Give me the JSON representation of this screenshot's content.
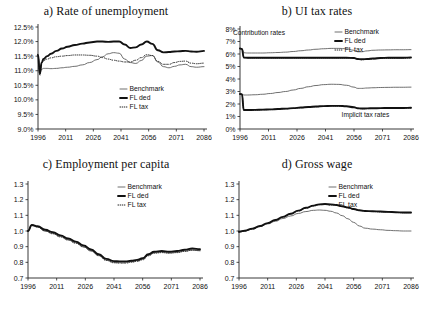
{
  "figure": {
    "background": "#ffffff",
    "series_colors": {
      "benchmark": "#555555",
      "fl_ded": "#111111",
      "fl_tax": "#222222"
    },
    "legend_labels": {
      "benchmark": "Benchmark",
      "fl_ded": "FL ded",
      "fl_tax": "FL tax"
    }
  },
  "panels": {
    "a": {
      "title": "a) Rate of unemployment"
    },
    "b": {
      "title": "b) UI tax rates"
    },
    "c": {
      "title": "c) Employment per capita"
    },
    "d": {
      "title": "d) Gross wage"
    }
  },
  "chart_data": [
    {
      "id": "panel-a",
      "type": "line",
      "title": "a) Rate of unemployment",
      "xlabel": "",
      "ylabel": "",
      "xlim": [
        1996,
        2086
      ],
      "ylim": [
        9.0,
        12.5
      ],
      "grid": false,
      "legend_position": "bottom-right",
      "xticks": [
        1996,
        2011,
        2026,
        2041,
        2056,
        2071,
        2086
      ],
      "xtick_labels": [
        "1996",
        "2011",
        "2026",
        "2041",
        "2056",
        "2071",
        "2086"
      ],
      "yticks": [
        9.0,
        9.5,
        10.0,
        10.5,
        11.0,
        11.5,
        12.0,
        12.5
      ],
      "ytick_labels": [
        "9.0%",
        "9.5%",
        "10.0%",
        "10.5%",
        "11.0%",
        "11.5%",
        "12.0%",
        "12.5%"
      ],
      "x": [
        1996,
        1997,
        1998,
        1999,
        2001,
        2003,
        2006,
        2009,
        2012,
        2016,
        2020,
        2024,
        2028,
        2031,
        2034,
        2037,
        2040,
        2043,
        2046,
        2049,
        2052,
        2055,
        2058,
        2061,
        2064,
        2067,
        2070,
        2073,
        2076,
        2079,
        2082,
        2086
      ],
      "series": [
        {
          "name": "Benchmark",
          "values": [
            11.55,
            10.95,
            11.05,
            11.08,
            11.08,
            11.07,
            11.08,
            11.1,
            11.12,
            11.15,
            11.2,
            11.28,
            11.38,
            11.48,
            11.58,
            11.62,
            11.6,
            11.4,
            11.28,
            11.25,
            11.35,
            11.5,
            11.52,
            11.3,
            11.14,
            11.1,
            11.15,
            11.2,
            11.22,
            11.14,
            11.12,
            11.14
          ]
        },
        {
          "name": "FL ded",
          "values": [
            11.55,
            10.9,
            11.28,
            11.4,
            11.5,
            11.58,
            11.68,
            11.76,
            11.82,
            11.88,
            11.93,
            11.97,
            12.0,
            12.0,
            11.99,
            12.0,
            12.0,
            11.9,
            11.78,
            11.8,
            11.9,
            12.0,
            11.92,
            11.7,
            11.63,
            11.64,
            11.66,
            11.67,
            11.68,
            11.66,
            11.65,
            11.68
          ]
        },
        {
          "name": "FL tax",
          "values": [
            11.52,
            10.85,
            11.25,
            11.35,
            11.4,
            11.44,
            11.48,
            11.5,
            11.52,
            11.54,
            11.54,
            11.53,
            11.5,
            11.45,
            11.4,
            11.36,
            11.33,
            11.3,
            11.3,
            11.36,
            11.45,
            11.55,
            11.52,
            11.32,
            11.22,
            11.22,
            11.28,
            11.32,
            11.33,
            11.26,
            11.24,
            11.26
          ]
        }
      ]
    },
    {
      "id": "panel-b",
      "type": "line",
      "title": "b) UI tax rates",
      "xlabel": "",
      "ylabel": "",
      "xlim": [
        1996,
        2086
      ],
      "ylim": [
        0,
        8
      ],
      "grid": false,
      "legend_position": "top-right",
      "annotations": [
        {
          "text": "Contribution rates",
          "x": 2006,
          "y": 7.55
        },
        {
          "text": "Implicit tax rates",
          "x": 2062,
          "y": 0.95
        }
      ],
      "xticks": [
        1996,
        2011,
        2026,
        2041,
        2056,
        2071,
        2086
      ],
      "xtick_labels": [
        "1996",
        "2011",
        "2026",
        "2041",
        "2056",
        "2071",
        "2086"
      ],
      "yticks": [
        0,
        1,
        2,
        3,
        4,
        5,
        6,
        7,
        8
      ],
      "ytick_labels": [
        "0%",
        "1%",
        "2%",
        "3%",
        "4%",
        "5%",
        "6%",
        "7%",
        "8%"
      ],
      "x": [
        1996,
        1997,
        1998,
        2000,
        2004,
        2008,
        2012,
        2016,
        2020,
        2024,
        2028,
        2032,
        2036,
        2040,
        2044,
        2048,
        2052,
        2056,
        2058,
        2060,
        2063,
        2066,
        2070,
        2074,
        2078,
        2082,
        2086
      ],
      "groups": [
        {
          "group": "Contribution rates",
          "series": [
            {
              "name": "Benchmark",
              "values": [
                6.45,
                6.42,
                6.1,
                6.08,
                6.08,
                6.08,
                6.1,
                6.12,
                6.15,
                6.2,
                6.26,
                6.32,
                6.38,
                6.42,
                6.45,
                6.45,
                6.42,
                6.3,
                6.18,
                6.18,
                6.25,
                6.3,
                6.32,
                6.33,
                6.34,
                6.34,
                6.35
              ]
            },
            {
              "name": "FL ded",
              "values": [
                6.45,
                6.4,
                5.72,
                5.7,
                5.7,
                5.7,
                5.7,
                5.7,
                5.7,
                5.7,
                5.7,
                5.7,
                5.7,
                5.7,
                5.7,
                5.7,
                5.7,
                5.68,
                5.6,
                5.58,
                5.6,
                5.64,
                5.68,
                5.7,
                5.7,
                5.7,
                5.72
              ]
            },
            {
              "name": "FL tax",
              "values": [
                6.42,
                6.38,
                5.7,
                5.68,
                5.68,
                5.68,
                5.68,
                5.68,
                5.68,
                5.68,
                5.68,
                5.68,
                5.68,
                5.68,
                5.68,
                5.68,
                5.68,
                5.64,
                5.56,
                5.54,
                5.56,
                5.6,
                5.64,
                5.66,
                5.66,
                5.66,
                5.68
              ]
            }
          ]
        },
        {
          "group": "Implicit tax rates",
          "series": [
            {
              "name": "Benchmark",
              "values": [
                2.8,
                2.78,
                2.72,
                2.72,
                2.74,
                2.78,
                2.84,
                2.92,
                3.0,
                3.12,
                3.25,
                3.38,
                3.48,
                3.55,
                3.58,
                3.57,
                3.5,
                3.35,
                3.25,
                3.25,
                3.28,
                3.3,
                3.32,
                3.33,
                3.34,
                3.34,
                3.35
              ]
            },
            {
              "name": "FL ded",
              "values": [
                2.8,
                2.78,
                1.52,
                1.52,
                1.53,
                1.55,
                1.57,
                1.6,
                1.63,
                1.67,
                1.72,
                1.76,
                1.8,
                1.83,
                1.85,
                1.85,
                1.82,
                1.74,
                1.66,
                1.64,
                1.65,
                1.66,
                1.67,
                1.68,
                1.68,
                1.68,
                1.7
              ]
            },
            {
              "name": "FL tax",
              "values": [
                2.78,
                2.76,
                1.5,
                1.5,
                1.51,
                1.53,
                1.55,
                1.58,
                1.61,
                1.65,
                1.7,
                1.74,
                1.78,
                1.81,
                1.83,
                1.83,
                1.8,
                1.72,
                1.64,
                1.62,
                1.63,
                1.64,
                1.65,
                1.66,
                1.66,
                1.66,
                1.68
              ]
            }
          ]
        }
      ]
    },
    {
      "id": "panel-c",
      "type": "line",
      "title": "c) Employment per capita",
      "xlabel": "",
      "ylabel": "",
      "xlim": [
        1996,
        2086
      ],
      "ylim": [
        0.7,
        1.3
      ],
      "grid": false,
      "legend_position": "top-right",
      "xticks": [
        1996,
        2011,
        2026,
        2041,
        2056,
        2071,
        2086
      ],
      "xtick_labels": [
        "1996",
        "2011",
        "2026",
        "2041",
        "2056",
        "2071",
        "2086"
      ],
      "yticks": [
        0.7,
        0.8,
        0.9,
        1.0,
        1.1,
        1.2,
        1.3
      ],
      "ytick_labels": [
        "0.7",
        "0.8",
        "0.9",
        "1.0",
        "1.1",
        "1.2",
        "1.3"
      ],
      "x": [
        1996,
        1998,
        2001,
        2005,
        2009,
        2013,
        2017,
        2021,
        2025,
        2029,
        2033,
        2037,
        2041,
        2044,
        2047,
        2050,
        2053,
        2056,
        2059,
        2062,
        2066,
        2070,
        2074,
        2078,
        2082,
        2086
      ],
      "series": [
        {
          "name": "Benchmark",
          "values": [
            1.0,
            1.035,
            1.025,
            1.0,
            0.985,
            0.965,
            0.945,
            0.925,
            0.9,
            0.875,
            0.845,
            0.815,
            0.8,
            0.8,
            0.8,
            0.805,
            0.81,
            0.82,
            0.845,
            0.862,
            0.865,
            0.862,
            0.865,
            0.872,
            0.878,
            0.875
          ]
        },
        {
          "name": "FL ded",
          "values": [
            1.0,
            1.038,
            1.03,
            1.008,
            0.992,
            0.972,
            0.952,
            0.932,
            0.908,
            0.882,
            0.852,
            0.822,
            0.808,
            0.806,
            0.806,
            0.81,
            0.816,
            0.826,
            0.852,
            0.868,
            0.872,
            0.868,
            0.872,
            0.88,
            0.888,
            0.884
          ]
        },
        {
          "name": "FL tax",
          "values": [
            1.0,
            1.04,
            1.026,
            1.0,
            0.982,
            0.962,
            0.942,
            0.922,
            0.898,
            0.872,
            0.842,
            0.812,
            0.797,
            0.795,
            0.795,
            0.8,
            0.806,
            0.816,
            0.842,
            0.858,
            0.862,
            0.858,
            0.862,
            0.87,
            0.878,
            0.874
          ]
        }
      ]
    },
    {
      "id": "panel-d",
      "type": "line",
      "title": "d) Gross wage",
      "xlabel": "",
      "ylabel": "",
      "xlim": [
        1996,
        2086
      ],
      "ylim": [
        0.7,
        1.3
      ],
      "grid": false,
      "legend_position": "top-right",
      "xticks": [
        1996,
        2011,
        2026,
        2041,
        2056,
        2071,
        2086
      ],
      "xtick_labels": [
        "1996",
        "2011",
        "2026",
        "2041",
        "2056",
        "2071",
        "2086"
      ],
      "yticks": [
        0.7,
        0.8,
        0.9,
        1.0,
        1.1,
        1.2,
        1.3
      ],
      "ytick_labels": [
        "0.7",
        "0.8",
        "0.9",
        "1.0",
        "1.1",
        "1.2",
        "1.3"
      ],
      "x": [
        1996,
        1999,
        2003,
        2007,
        2011,
        2015,
        2019,
        2023,
        2027,
        2031,
        2035,
        2038,
        2041,
        2044,
        2047,
        2050,
        2053,
        2056,
        2059,
        2062,
        2066,
        2070,
        2074,
        2078,
        2082,
        2086
      ],
      "series": [
        {
          "name": "Benchmark",
          "values": [
            0.995,
            1.0,
            1.012,
            1.028,
            1.045,
            1.062,
            1.08,
            1.096,
            1.112,
            1.124,
            1.132,
            1.134,
            1.132,
            1.126,
            1.115,
            1.098,
            1.078,
            1.055,
            1.032,
            1.018,
            1.012,
            1.008,
            1.004,
            1.002,
            1.0,
            1.0
          ]
        },
        {
          "name": "FL ded",
          "values": [
            0.995,
            1.002,
            1.015,
            1.032,
            1.05,
            1.07,
            1.09,
            1.11,
            1.13,
            1.148,
            1.162,
            1.17,
            1.172,
            1.17,
            1.166,
            1.158,
            1.15,
            1.14,
            1.132,
            1.128,
            1.126,
            1.124,
            1.122,
            1.12,
            1.118,
            1.118
          ]
        },
        {
          "name": "FL tax",
          "values": [
            0.993,
            1.0,
            1.013,
            1.03,
            1.048,
            1.068,
            1.088,
            1.108,
            1.128,
            1.146,
            1.16,
            1.168,
            1.17,
            1.168,
            1.164,
            1.156,
            1.148,
            1.138,
            1.13,
            1.126,
            1.124,
            1.122,
            1.12,
            1.118,
            1.116,
            1.116
          ]
        }
      ]
    }
  ]
}
